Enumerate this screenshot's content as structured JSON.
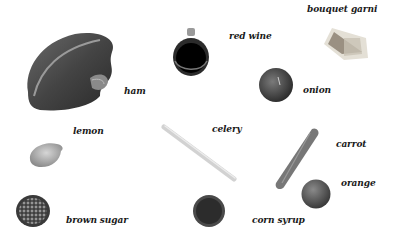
{
  "title": "",
  "items": [
    {
      "id": "ham",
      "label": "ham"
    },
    {
      "id": "red-wine",
      "label": "red wine"
    },
    {
      "id": "bouquet-garni",
      "label": "bouquet garni"
    },
    {
      "id": "onion",
      "label": "onion"
    },
    {
      "id": "lemon",
      "label": "lemon"
    },
    {
      "id": "celery",
      "label": "celery"
    },
    {
      "id": "carrot",
      "label": "carrot"
    },
    {
      "id": "orange",
      "label": "orange"
    },
    {
      "id": "brown-sugar",
      "label": "brown sugar"
    },
    {
      "id": "corn-syrup",
      "label": "corn syrup"
    }
  ],
  "colors": {
    "background": "#ffffff",
    "label": "#1a1a1a"
  }
}
